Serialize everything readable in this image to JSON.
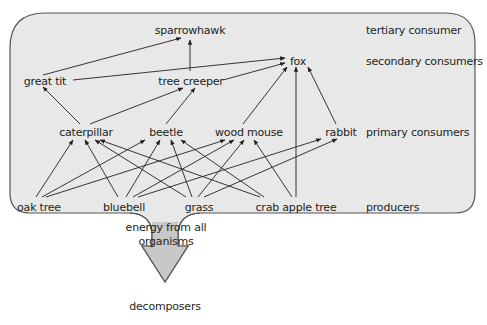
{
  "colors": {
    "panel_fill": "#e8e8e8",
    "panel_stroke": "#555555",
    "arrow_fill": "#c8c8c8",
    "line": "#231f20",
    "text": "#231f20"
  },
  "levels": {
    "tertiary": "tertiary consumer",
    "secondary": "secondary consumers",
    "primary": "primary consumers",
    "producers": "producers"
  },
  "nodes": {
    "sparrowhawk": "sparrowhawk",
    "fox": "fox",
    "great_tit": "great tit",
    "tree_creeper": "tree creeper",
    "caterpillar": "caterpillar",
    "beetle": "beetle",
    "wood_mouse": "wood mouse",
    "rabbit": "rabbit",
    "oak_tree": "oak tree",
    "bluebell": "bluebell",
    "grass": "grass",
    "crab_apple_tree": "crab apple tree",
    "decomposers": "decomposers"
  },
  "energy_label_line1": "energy from all",
  "energy_label_line2": "organisms",
  "edges": [
    {
      "from": "oak tree",
      "to": "caterpillar"
    },
    {
      "from": "oak tree",
      "to": "beetle"
    },
    {
      "from": "oak tree",
      "to": "wood mouse"
    },
    {
      "from": "bluebell",
      "to": "caterpillar"
    },
    {
      "from": "bluebell",
      "to": "beetle"
    },
    {
      "from": "bluebell",
      "to": "wood mouse"
    },
    {
      "from": "bluebell",
      "to": "rabbit"
    },
    {
      "from": "grass",
      "to": "caterpillar"
    },
    {
      "from": "grass",
      "to": "beetle"
    },
    {
      "from": "grass",
      "to": "wood mouse"
    },
    {
      "from": "grass",
      "to": "rabbit"
    },
    {
      "from": "crab apple tree",
      "to": "caterpillar"
    },
    {
      "from": "crab apple tree",
      "to": "beetle"
    },
    {
      "from": "crab apple tree",
      "to": "wood mouse"
    },
    {
      "from": "crab apple tree",
      "to": "fox"
    },
    {
      "from": "caterpillar",
      "to": "great tit"
    },
    {
      "from": "caterpillar",
      "to": "tree creeper"
    },
    {
      "from": "beetle",
      "to": "tree creeper"
    },
    {
      "from": "wood mouse",
      "to": "fox"
    },
    {
      "from": "rabbit",
      "to": "fox"
    },
    {
      "from": "great tit",
      "to": "sparrowhawk"
    },
    {
      "from": "tree creeper",
      "to": "sparrowhawk"
    },
    {
      "from": "great tit",
      "to": "fox"
    },
    {
      "from": "tree creeper",
      "to": "fox"
    }
  ]
}
